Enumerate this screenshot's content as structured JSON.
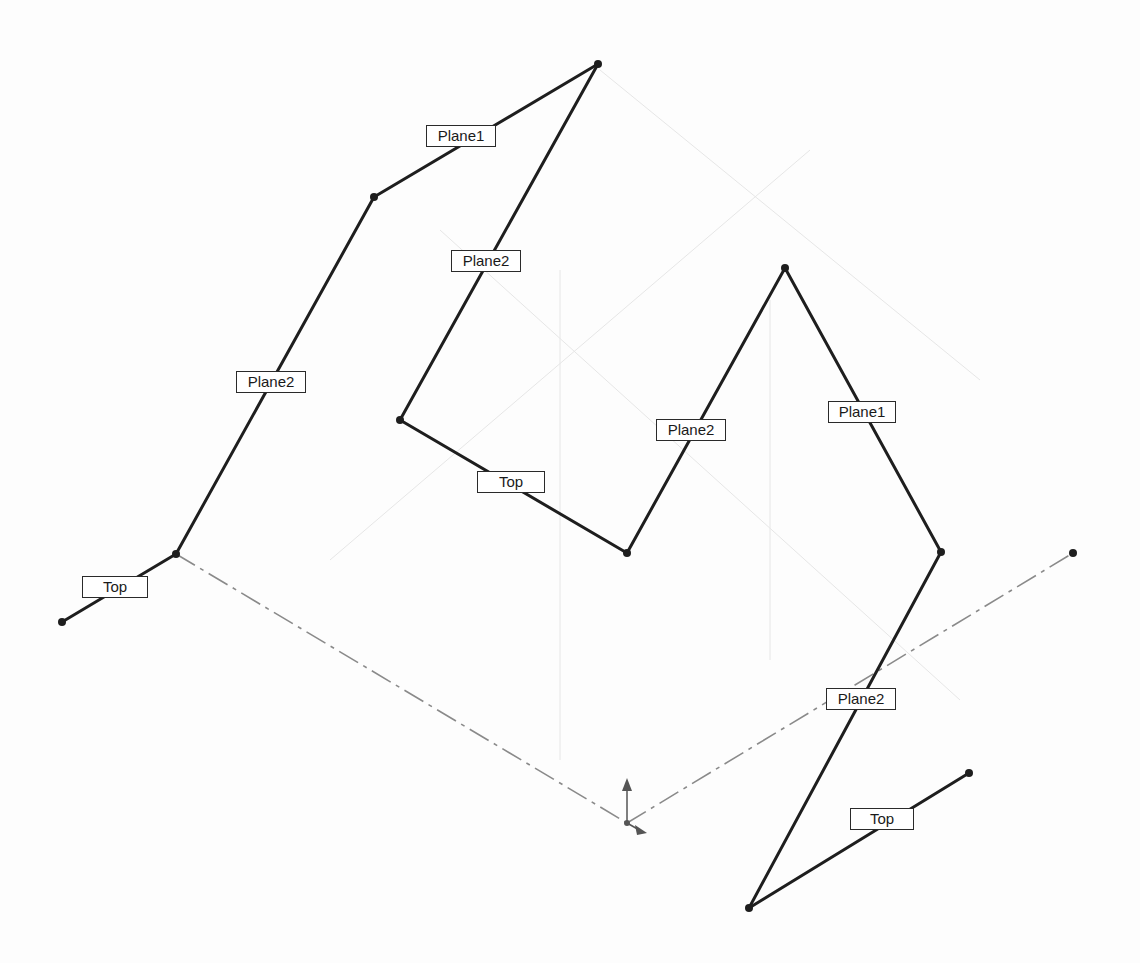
{
  "view": {
    "background": "#fdfdfd",
    "line_color": "#1e1e1e",
    "centerline_color": "#8a8a8a"
  },
  "vertices": [
    {
      "id": "v1",
      "x": 62,
      "y": 622
    },
    {
      "id": "v2",
      "x": 176,
      "y": 554
    },
    {
      "id": "v3",
      "x": 374,
      "y": 197
    },
    {
      "id": "v4",
      "x": 598,
      "y": 64
    },
    {
      "id": "v5",
      "x": 400,
      "y": 420
    },
    {
      "id": "v6",
      "x": 627,
      "y": 553
    },
    {
      "id": "v7",
      "x": 785,
      "y": 268
    },
    {
      "id": "v8",
      "x": 941,
      "y": 552
    },
    {
      "id": "v9",
      "x": 749,
      "y": 908
    },
    {
      "id": "v10",
      "x": 969,
      "y": 773
    },
    {
      "id": "v11",
      "x": 1073,
      "y": 553
    }
  ],
  "segments": [
    {
      "from": "v1",
      "to": "v2"
    },
    {
      "from": "v2",
      "to": "v3"
    },
    {
      "from": "v3",
      "to": "v4"
    },
    {
      "from": "v4",
      "to": "v5"
    },
    {
      "from": "v5",
      "to": "v6"
    },
    {
      "from": "v6",
      "to": "v7"
    },
    {
      "from": "v7",
      "to": "v8"
    },
    {
      "from": "v8",
      "to": "v9"
    },
    {
      "from": "v9",
      "to": "v10"
    }
  ],
  "centerlines": [
    {
      "x1": 176,
      "y1": 554,
      "x2": 627,
      "y2": 823
    },
    {
      "x1": 627,
      "y1": 823,
      "x2": 1073,
      "y2": 553
    }
  ],
  "labels": [
    {
      "text": "Top",
      "x": 82,
      "y": 576,
      "w": 66,
      "h": 22
    },
    {
      "text": "Plane2",
      "x": 236,
      "y": 371,
      "w": 70,
      "h": 22
    },
    {
      "text": "Plane1",
      "x": 426,
      "y": 125,
      "w": 70,
      "h": 22
    },
    {
      "text": "Plane2",
      "x": 451,
      "y": 250,
      "w": 70,
      "h": 22
    },
    {
      "text": "Top",
      "x": 477,
      "y": 471,
      "w": 68,
      "h": 22
    },
    {
      "text": "Plane2",
      "x": 656,
      "y": 419,
      "w": 70,
      "h": 22
    },
    {
      "text": "Plane1",
      "x": 828,
      "y": 401,
      "w": 68,
      "h": 22
    },
    {
      "text": "Plane2",
      "x": 826,
      "y": 688,
      "w": 70,
      "h": 22
    },
    {
      "text": "Top",
      "x": 850,
      "y": 808,
      "w": 64,
      "h": 22
    }
  ],
  "origin": {
    "x": 627,
    "y": 823
  }
}
